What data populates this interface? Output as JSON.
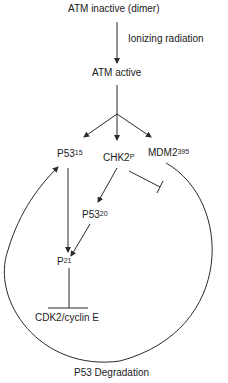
{
  "diagram": {
    "nodes": {
      "atm_inactive": {
        "label": "ATM inactive (dimer)"
      },
      "ionizing": {
        "label": "Ionizing radiation"
      },
      "atm_active": {
        "label": "ATM active"
      },
      "p53_15": {
        "label": "P53",
        "sup": "15"
      },
      "chk2": {
        "label": "CHK2",
        "sup": "P"
      },
      "mdm2": {
        "label": "MDM2",
        "sup": "395"
      },
      "p53_20": {
        "label": "P53",
        "sup": "20"
      },
      "p21": {
        "label": "P",
        "sup": "21"
      },
      "cdk2": {
        "label": "CDK2/cyclin E"
      },
      "degradation": {
        "label": "P53 Degradation"
      }
    },
    "edges": [
      {
        "from": "ATM inactive (dimer)",
        "to": "ATM active",
        "type": "activation",
        "label": "Ionizing radiation"
      },
      {
        "from": "ATM active",
        "to": "P53 15",
        "type": "activation"
      },
      {
        "from": "ATM active",
        "to": "CHK2 P",
        "type": "activation"
      },
      {
        "from": "ATM active",
        "to": "MDM2 395",
        "type": "activation"
      },
      {
        "from": "CHK2 P",
        "to": "P53 20",
        "type": "activation"
      },
      {
        "from": "CHK2 P",
        "to": "MDM2 loop",
        "type": "inhibition"
      },
      {
        "from": "P53 15",
        "to": "P21",
        "type": "activation"
      },
      {
        "from": "P53 20",
        "to": "P21",
        "type": "activation"
      },
      {
        "from": "P21",
        "to": "CDK2/cyclin E",
        "type": "inhibition"
      },
      {
        "from": "MDM2 395",
        "to": "P53 15",
        "type": "activation",
        "via": "P53 Degradation loop"
      }
    ],
    "colors": {
      "line": "#2a2a2a",
      "text": "#1a1a1a",
      "background": "#ffffff"
    }
  }
}
